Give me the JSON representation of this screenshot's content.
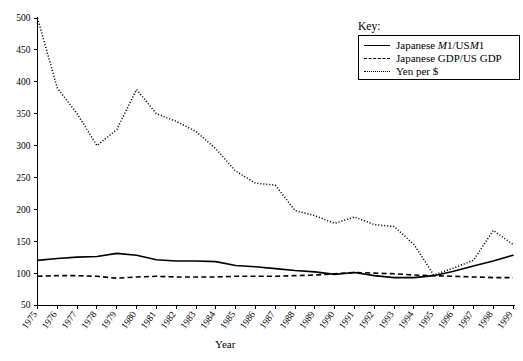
{
  "chart_data": {
    "type": "line",
    "title": "",
    "xlabel": "Year",
    "ylabel": "",
    "xlim": [
      1975,
      1999
    ],
    "ylim": [
      50,
      500
    ],
    "grid": false,
    "legend_position": "top-right",
    "legend_title": "Key:",
    "x": [
      1975,
      1976,
      1977,
      1978,
      1979,
      1980,
      1981,
      1982,
      1983,
      1984,
      1985,
      1986,
      1987,
      1988,
      1989,
      1990,
      1991,
      1992,
      1993,
      1994,
      1995,
      1996,
      1997,
      1998,
      1999
    ],
    "categories": [
      "1975",
      "1976",
      "1977",
      "1978",
      "1979",
      "1980",
      "1981",
      "1982",
      "1983",
      "1984",
      "1985",
      "1986",
      "1987",
      "1988",
      "1989",
      "1990",
      "1991",
      "1992",
      "1993",
      "1994",
      "1995",
      "1996",
      "1997",
      "1998",
      "1999"
    ],
    "yticks": [
      50,
      100,
      150,
      200,
      250,
      300,
      350,
      400,
      450,
      500
    ],
    "ytick_labels": [
      "50",
      "100",
      "150",
      "200",
      "250",
      "300",
      "350",
      "400",
      "450",
      "500"
    ],
    "series": [
      {
        "name": "Japanese M1/US M1",
        "style": "solid",
        "values": [
          120,
          123,
          125,
          126,
          131,
          128,
          121,
          119,
          119,
          118,
          112,
          110,
          107,
          104,
          102,
          98,
          101,
          96,
          93,
          93,
          96,
          103,
          111,
          119,
          128
        ]
      },
      {
        "name": "Japanese GDP/US GDP",
        "style": "dashed",
        "values": [
          95,
          96,
          96,
          95,
          92,
          94,
          95,
          94,
          94,
          94,
          95,
          95,
          95,
          96,
          97,
          99,
          101,
          100,
          99,
          97,
          96,
          95,
          94,
          93,
          93
        ]
      },
      {
        "name": "Yen per $",
        "style": "dotted",
        "values": [
          500,
          390,
          350,
          300,
          325,
          388,
          350,
          338,
          322,
          295,
          260,
          241,
          238,
          198,
          190,
          178,
          188,
          176,
          173,
          145,
          97,
          108,
          120,
          167,
          145
        ]
      }
    ]
  },
  "legend": {
    "title": "Key:",
    "items": [
      {
        "label_prefix": "Japanese ",
        "label_italic_1": "M",
        "label_mid": "1/US",
        "label_italic_2": "M",
        "label_suffix": "1",
        "style": "solid",
        "full": "Japanese M1/USM1"
      },
      {
        "label": "Japanese GDP/US GDP",
        "style": "dashed"
      },
      {
        "label": "Yen per $",
        "style": "dotted"
      }
    ]
  },
  "axis": {
    "x_title": "Year"
  },
  "colors": {
    "line": "#000000",
    "background": "#ffffff",
    "axis": "#000000"
  }
}
